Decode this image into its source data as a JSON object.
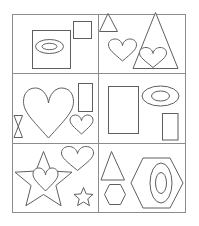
{
  "canvas": {
    "width": 199,
    "height": 226,
    "background": "#ffffff"
  },
  "colors": {
    "outline": "#5f5f5f",
    "grid": "#8c8c8c",
    "shape_fill": "#ffffff"
  },
  "grid": {
    "rows": 3,
    "columns": 2
  },
  "cells": [
    {
      "position": "top-left",
      "shapes": [
        "square containing oval ring",
        "small square"
      ]
    },
    {
      "position": "top-right",
      "shapes": [
        "small triangle",
        "heart",
        "large triangle with heart inside"
      ]
    },
    {
      "position": "middle-left",
      "shapes": [
        "hourglass",
        "large heart",
        "vertical rectangle",
        "small heart"
      ]
    },
    {
      "position": "middle-right",
      "shapes": [
        "large vertical rectangle",
        "oval ring",
        "small vertical rectangle"
      ]
    },
    {
      "position": "bottom-left",
      "shapes": [
        "large five-point star with heart overlay",
        "heart",
        "small five-point star"
      ]
    },
    {
      "position": "bottom-right",
      "shapes": [
        "triangle",
        "small hexagon",
        "large hexagon with oval ring"
      ]
    }
  ]
}
